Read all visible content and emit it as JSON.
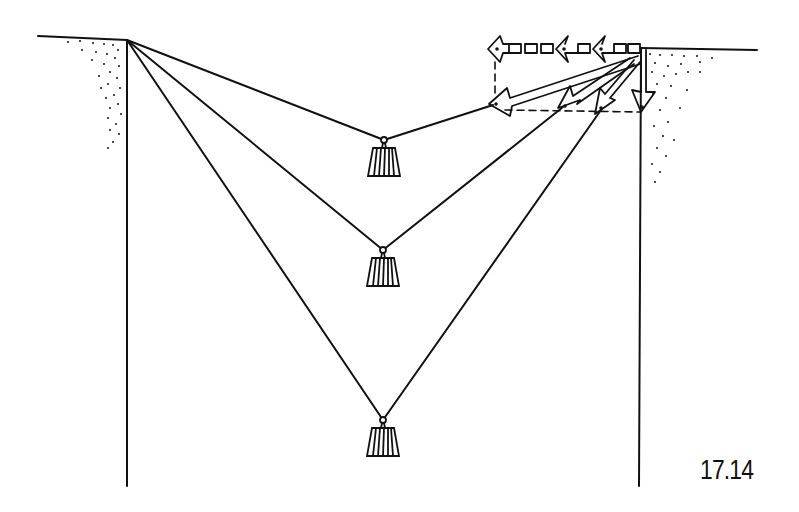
{
  "figure": {
    "label": "17.14",
    "colors": {
      "ink": "#111111",
      "background": "#ffffff"
    }
  },
  "elements": {
    "left_cliff": {
      "anchor": [
        127,
        40
      ]
    },
    "right_cliff": {
      "anchor": [
        641,
        48
      ]
    },
    "weights": [
      {
        "name": "weight-shallow",
        "hang_point": [
          384,
          140
        ]
      },
      {
        "name": "weight-medium",
        "hang_point": [
          383,
          250
        ]
      },
      {
        "name": "weight-deep",
        "hang_point": [
          383,
          420
        ]
      }
    ],
    "force_vectors": {
      "horizontal_arrows": 3,
      "diagonal_arrows": 3,
      "vertical_arrow": 1
    }
  }
}
